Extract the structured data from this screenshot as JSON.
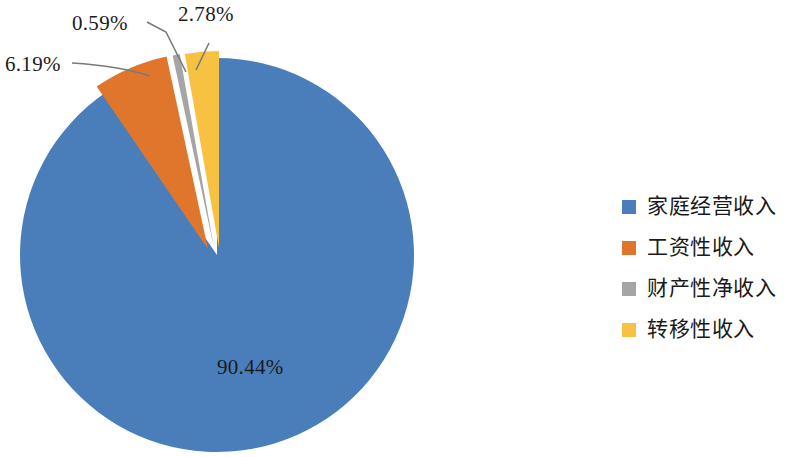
{
  "chart_data": {
    "type": "pie",
    "title": "",
    "categories": [
      "家庭经营收入",
      "工资性收入",
      "财产性净收入",
      "转移性收入"
    ],
    "values": [
      90.44,
      6.19,
      0.59,
      2.78
    ],
    "value_labels": [
      "90.44%",
      "6.19%",
      "0.59%",
      "2.78%"
    ],
    "colors": [
      "#4a7ebb",
      "#e0762b",
      "#a5a5a5",
      "#f7c242"
    ],
    "units": "percent",
    "legend_position": "right",
    "grid": false,
    "exploded_slices": [
      "工资性收入",
      "财产性净收入",
      "转移性收入"
    ],
    "start_angle_deg": 0,
    "direction": "clockwise",
    "labels_outside": [
      "6.19%",
      "0.59%",
      "2.78%"
    ],
    "labels_inside": [
      "90.44%"
    ]
  },
  "pie": {
    "center_x": 217,
    "center_y": 255,
    "radius": 197,
    "slices": [
      {
        "name": "家庭经营收入",
        "label": "90.44%",
        "color": "#4a7ebb"
      },
      {
        "name": "工资性收入",
        "label": "6.19%",
        "color": "#e0762b"
      },
      {
        "name": "财产性净收入",
        "label": "0.59%",
        "color": "#a5a5a5"
      },
      {
        "name": "转移性收入",
        "label": "2.78%",
        "color": "#f7c242"
      }
    ]
  },
  "labels": {
    "blue": "90.44%",
    "orange": "6.19%",
    "gray": "0.59%",
    "yellow": "2.78%"
  },
  "legend": {
    "items": [
      {
        "label": "家庭经营收入",
        "color": "#4a7ebb"
      },
      {
        "label": "工资性收入",
        "color": "#e0762b"
      },
      {
        "label": "财产性净收入",
        "color": "#a5a5a5"
      },
      {
        "label": "转移性收入",
        "color": "#f7c242"
      }
    ]
  }
}
